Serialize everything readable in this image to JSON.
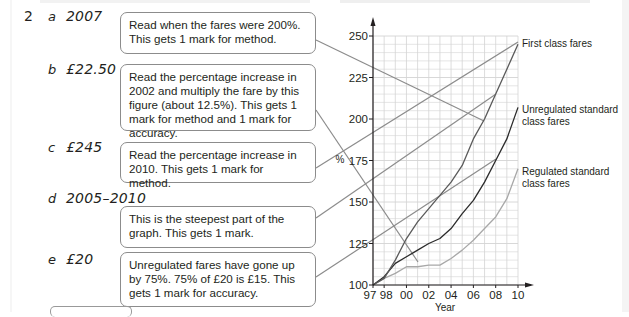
{
  "question_number": "2",
  "answers": [
    {
      "letter": "a",
      "value": "2007",
      "note": "Read when the fares were 200%. This gets 1 mark for method."
    },
    {
      "letter": "b",
      "value": "£22.50",
      "note": "Read the percentage increase in 2002 and multiply the fare by this figure (about 12.5%). This gets 1 mark for method and 1 mark for accuracy."
    },
    {
      "letter": "c",
      "value": "£245",
      "note": "Read the percentage increase in 2010. This gets 1 mark for method."
    },
    {
      "letter": "d",
      "value": "2005–2010",
      "note": "This is the steepest part of the graph. This gets 1 mark."
    },
    {
      "letter": "e",
      "value": "£20",
      "note": "Unregulated fares have gone up by 75%. 75% of £20 is £15. This gets 1 mark for accuracy."
    }
  ],
  "chart_data": {
    "type": "line",
    "title": "",
    "xlabel": "Year",
    "ylabel": "%",
    "x": [
      1997,
      1998,
      1999,
      2000,
      2001,
      2002,
      2003,
      2004,
      2005,
      2006,
      2007,
      2008,
      2009,
      2010
    ],
    "x_tick_labels": [
      "97",
      "98",
      "00",
      "02",
      "04",
      "06",
      "08",
      "10"
    ],
    "y_tick_labels": [
      "100",
      "125",
      "150",
      "175",
      "200",
      "225",
      "250"
    ],
    "ylim": [
      100,
      250
    ],
    "xlim": [
      1997,
      2010
    ],
    "grid": true,
    "legend_position": "right, labels next to line ends",
    "series": [
      {
        "name": "First class fares",
        "color": "#5a5a5a",
        "values": [
          100,
          104,
          115,
          128,
          138,
          146,
          154,
          162,
          172,
          188,
          200,
          215,
          230,
          245
        ]
      },
      {
        "name": "Unregulated standard class fares",
        "color": "#2b2b2b",
        "values": [
          100,
          105,
          113,
          117,
          121,
          125,
          128,
          134,
          143,
          151,
          162,
          175,
          188,
          207
        ]
      },
      {
        "name": "Regulated standard class fares",
        "color": "#a8a8a8",
        "values": [
          100,
          104,
          107,
          111,
          111,
          112,
          112,
          116,
          121,
          127,
          134,
          141,
          152,
          170
        ]
      }
    ]
  },
  "legend": {
    "first_class": "First class fares",
    "unregulated_1": "Unregulated standard",
    "unregulated_2": "class fares",
    "regulated_1": "Regulated standard",
    "regulated_2": "class fares"
  },
  "axis": {
    "y_label": "%",
    "x_label": "Year"
  },
  "colors": {
    "grid": "#d4d4d4",
    "axis": "#231f20",
    "connector": "#8c8c8c",
    "note_border": "#8c8c8c"
  }
}
